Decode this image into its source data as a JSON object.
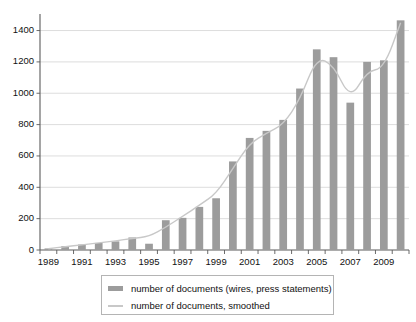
{
  "chart_data": {
    "type": "bar",
    "title": "",
    "subtitle": "",
    "xlabel": "",
    "ylabel": "",
    "grid": true,
    "legend_position": "bottom",
    "xlim": [
      1988.5,
      2010.5
    ],
    "ylim": [
      0,
      1480
    ],
    "y_ticks": [
      0,
      200,
      400,
      600,
      800,
      1000,
      1200,
      1400
    ],
    "y_tick_labels": [
      "0",
      "200",
      "400",
      "600",
      "800",
      "1000",
      "1200",
      "1400"
    ],
    "x_tick_labels": [
      "1989",
      "1991",
      "1993",
      "1995",
      "1997",
      "1999",
      "2001",
      "2003",
      "2005",
      "2007",
      "2009"
    ],
    "categories": [
      1989,
      1990,
      1991,
      1992,
      1993,
      1994,
      1995,
      1996,
      1997,
      1998,
      1999,
      2000,
      2001,
      2002,
      2003,
      2004,
      2005,
      2006,
      2007,
      2008,
      2009,
      2010
    ],
    "series": [
      {
        "name": "number of documents (wires, press statements)",
        "type": "bar",
        "color": "#9c9c9c",
        "values": [
          10,
          25,
          35,
          45,
          55,
          80,
          40,
          190,
          205,
          275,
          330,
          565,
          715,
          760,
          830,
          1030,
          1280,
          1230,
          940,
          1200,
          1210,
          1465
        ]
      },
      {
        "name": "number of documents, smoothed",
        "type": "line",
        "color": "#c8c8c8",
        "values": [
          8,
          22,
          33,
          45,
          58,
          75,
          85,
          145,
          215,
          285,
          360,
          520,
          680,
          745,
          800,
          960,
          1230,
          1180,
          960,
          1140,
          1160,
          1450
        ]
      }
    ],
    "legend": [
      {
        "label": "number of documents (wires, press statements)",
        "marker": "bar",
        "color": "#9c9c9c"
      },
      {
        "label": "number of documents, smoothed",
        "marker": "line",
        "color": "#c8c8c8"
      }
    ]
  },
  "colors": {
    "bar": "#9c9c9c",
    "smooth_line": "#c8c8c8",
    "grid": "#cfcfcf",
    "axis": "#5a5a5a",
    "text": "#111111",
    "background": "#ffffff"
  }
}
